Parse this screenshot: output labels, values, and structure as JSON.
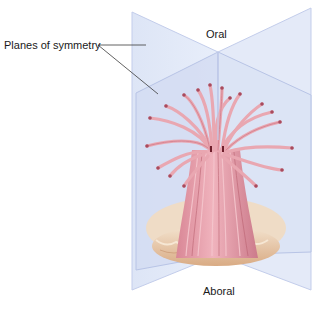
{
  "figure": {
    "labels": {
      "planes": "Planes of symmetry",
      "oral": "Oral",
      "aboral": "Aboral"
    },
    "colors": {
      "plane_fill": "#dfe6f6",
      "plane_fill_dark": "#c9d3ee",
      "plane_edge": "#b7c3e6",
      "tentacle": "#e8a3ad",
      "tentacle_dark": "#c76f7e",
      "tentacle_tip": "#a64659",
      "column": "#e39aa6",
      "base": "#e6c19e",
      "base_light": "#f0dcc4",
      "leader_line": "#333333"
    }
  }
}
